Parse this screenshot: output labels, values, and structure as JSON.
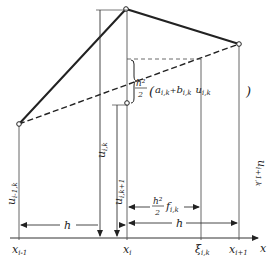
{
  "diagram": {
    "type": "finite-difference-scheme",
    "colors": {
      "ink": "#222222",
      "thin": "#555555",
      "background": "#ffffff"
    },
    "axis": {
      "label": "x"
    },
    "nodes": [
      {
        "id": "x_im1",
        "label_base": "x",
        "label_sub": "i-1"
      },
      {
        "id": "x_i",
        "label_base": "x",
        "label_sub": "i"
      },
      {
        "id": "xi",
        "label_base": "ξ",
        "label_sub": "i,k"
      },
      {
        "id": "x_ip1",
        "label_base": "x",
        "label_sub": "i+1"
      }
    ],
    "ordinates": [
      {
        "id": "u_im1_k",
        "base": "u",
        "sub": "i-1,k"
      },
      {
        "id": "u_i_k",
        "base": "u",
        "sub": "i,k"
      },
      {
        "id": "u_i_kp1",
        "base": "u",
        "sub": "i,k+1"
      },
      {
        "id": "u_ip1_k",
        "base": "u",
        "sub": "i+1,k"
      }
    ],
    "spacing": {
      "left": "h",
      "right": "h"
    },
    "source_term": {
      "frac_num": "h²",
      "frac_den": "2",
      "term": "f",
      "sub": "i,k"
    },
    "bracket_term": {
      "frac_num": "h²",
      "frac_den": "2",
      "open": "(",
      "a": "a",
      "a_sub": "i,k",
      "plus": "+",
      "b": "b",
      "b_sub": "i,k",
      "u": "u",
      "u_sub": "i,k",
      "close": ")"
    }
  }
}
